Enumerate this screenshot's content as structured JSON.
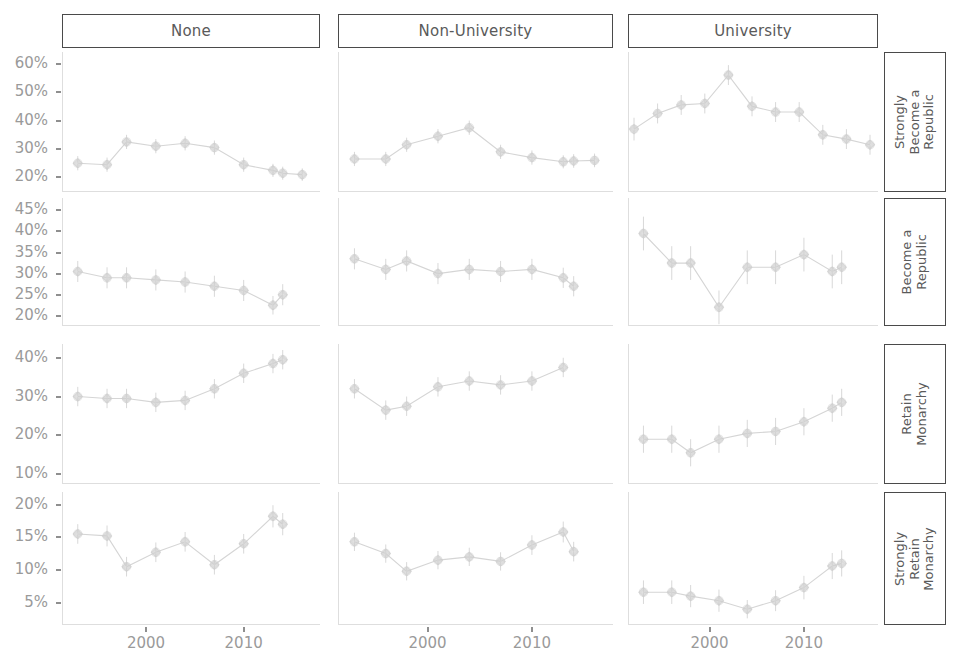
{
  "chart_data": {
    "type": "line",
    "title": "",
    "subtitle": "",
    "xlabel": "",
    "ylabel": "",
    "grid": false,
    "legend": "none",
    "facet_columns_label": "Education",
    "facet_rows_label": "Attitude to the Monarchy",
    "facet_columns": [
      "None",
      "Non-University",
      "University"
    ],
    "facet_rows": [
      "Strongly Become a Republic",
      "Become a Republic",
      "Retain Monarchy",
      "Strongly Retain Monarchy"
    ],
    "x": [
      1993,
      1996,
      1998,
      2001,
      2004,
      2007,
      2010,
      2013,
      2014,
      2016
    ],
    "xlim": [
      1992,
      2017
    ],
    "xticks": [
      2000,
      2010
    ],
    "xticklabels": [
      "2000",
      "2010"
    ],
    "row_axes": [
      {
        "row": "Strongly Become a Republic",
        "ylim": [
          17,
          62
        ],
        "yticks": [
          20,
          30,
          40,
          50,
          60
        ],
        "yticklabels": [
          "20%",
          "30%",
          "40%",
          "50%",
          "60%"
        ]
      },
      {
        "row": "Become a Republic",
        "ylim": [
          19,
          46.5
        ],
        "yticks": [
          20,
          25,
          30,
          35,
          40,
          45
        ],
        "yticklabels": [
          "20%",
          "25%",
          "30%",
          "35%",
          "40%",
          "45%"
        ]
      },
      {
        "row": "Retain Monarchy",
        "ylim": [
          9,
          42
        ],
        "yticks": [
          10,
          20,
          30,
          40
        ],
        "yticklabels": [
          "10%",
          "20%",
          "30%",
          "40%"
        ]
      },
      {
        "row": "Strongly Retain Monarchy",
        "ylim": [
          2.5,
          21
        ],
        "yticks": [
          5,
          10,
          15,
          20
        ],
        "yticklabels": [
          "5%",
          "10%",
          "15%",
          "20%"
        ]
      }
    ],
    "panels": [
      {
        "row": "Strongly Become a Republic",
        "column": "None",
        "values": [
          25.0,
          24.5,
          32.5,
          31.0,
          32.0,
          30.5,
          24.5,
          22.5,
          21.5,
          21.0
        ],
        "err_low": [
          22.5,
          22.0,
          30.0,
          28.5,
          29.5,
          28.0,
          22.0,
          20.2,
          19.2,
          18.8
        ],
        "err_high": [
          27.5,
          27.0,
          35.0,
          33.5,
          34.5,
          33.0,
          27.0,
          24.8,
          23.8,
          23.2
        ]
      },
      {
        "row": "Strongly Become a Republic",
        "column": "Non-University",
        "values": [
          26.5,
          26.5,
          31.5,
          34.5,
          37.5,
          29.0,
          27.0,
          25.5,
          25.8,
          26.0
        ],
        "err_low": [
          24.0,
          24.0,
          29.0,
          32.0,
          35.0,
          26.5,
          24.5,
          23.2,
          23.4,
          23.6
        ],
        "err_high": [
          29.0,
          29.0,
          34.0,
          37.0,
          40.0,
          31.5,
          29.5,
          27.8,
          28.2,
          28.4
        ]
      },
      {
        "row": "Strongly Become a Republic",
        "column": "University",
        "values": [
          37.0,
          42.5,
          45.5,
          46.0,
          56.0,
          45.0,
          43.0,
          43.0,
          35.0,
          33.5,
          31.5
        ],
        "err_low": [
          33.0,
          39.0,
          42.0,
          42.5,
          52.5,
          41.5,
          39.5,
          39.5,
          31.5,
          30.0,
          28.0
        ],
        "err_high": [
          41.0,
          46.0,
          49.0,
          49.5,
          59.5,
          48.5,
          46.5,
          46.5,
          38.5,
          37.0,
          35.0
        ]
      },
      {
        "row": "Become a Republic",
        "column": "None",
        "values": [
          30.5,
          29.0,
          29.0,
          28.5,
          28.0,
          27.0,
          26.0,
          22.5,
          25.0
        ],
        "err_low": [
          28.0,
          26.5,
          26.5,
          26.0,
          25.5,
          24.5,
          23.5,
          20.3,
          22.5
        ],
        "err_high": [
          33.0,
          31.5,
          31.5,
          31.0,
          30.5,
          29.5,
          28.5,
          24.7,
          27.5
        ]
      },
      {
        "row": "Become a Republic",
        "column": "Non-University",
        "values": [
          33.5,
          31.0,
          33.0,
          30.0,
          31.0,
          30.5,
          31.0,
          29.0,
          27.0
        ],
        "err_low": [
          31.0,
          28.5,
          30.5,
          27.5,
          28.5,
          28.0,
          28.5,
          26.6,
          24.6
        ],
        "err_high": [
          36.0,
          33.5,
          35.5,
          32.5,
          33.5,
          33.0,
          33.5,
          31.4,
          29.4
        ]
      },
      {
        "row": "Become a Republic",
        "column": "University",
        "values": [
          39.5,
          32.5,
          32.5,
          22.0,
          31.5,
          31.5,
          34.5,
          30.5,
          31.5
        ],
        "err_low": [
          35.5,
          28.5,
          28.5,
          18.0,
          27.5,
          27.5,
          30.5,
          26.5,
          27.5
        ],
        "err_high": [
          43.5,
          36.5,
          36.5,
          26.0,
          35.5,
          35.5,
          38.5,
          34.5,
          35.5
        ]
      },
      {
        "row": "Retain Monarchy",
        "column": "None",
        "values": [
          30.0,
          29.5,
          29.5,
          28.5,
          29.0,
          32.0,
          36.0,
          38.5,
          39.5
        ],
        "err_low": [
          27.5,
          27.0,
          27.0,
          26.0,
          26.5,
          29.5,
          33.5,
          36.0,
          37.0
        ],
        "err_high": [
          32.5,
          32.0,
          32.0,
          31.0,
          31.5,
          34.5,
          38.5,
          41.0,
          42.0
        ]
      },
      {
        "row": "Retain Monarchy",
        "column": "Non-University",
        "values": [
          32.0,
          26.5,
          27.5,
          32.5,
          34.0,
          33.0,
          34.0,
          37.5
        ],
        "err_low": [
          29.5,
          24.0,
          25.0,
          30.0,
          31.5,
          30.5,
          31.5,
          35.0
        ],
        "err_high": [
          34.5,
          29.0,
          30.0,
          35.0,
          36.5,
          35.5,
          36.5,
          40.0
        ]
      },
      {
        "row": "Retain Monarchy",
        "column": "University",
        "values": [
          19.0,
          19.0,
          15.5,
          19.0,
          20.5,
          21.0,
          23.5,
          27.0,
          28.5
        ],
        "err_low": [
          15.5,
          15.5,
          12.0,
          15.5,
          17.0,
          17.5,
          20.0,
          23.5,
          25.0
        ],
        "err_high": [
          22.5,
          22.5,
          19.0,
          22.5,
          24.0,
          24.5,
          27.0,
          30.5,
          32.0
        ]
      },
      {
        "row": "Strongly Retain Monarchy",
        "column": "None",
        "values": [
          15.5,
          15.2,
          10.5,
          12.7,
          14.3,
          10.8,
          14.0,
          18.2,
          17.0
        ],
        "err_low": [
          14.0,
          13.6,
          9.0,
          11.2,
          12.8,
          9.3,
          12.5,
          16.5,
          15.3
        ],
        "err_high": [
          17.0,
          16.8,
          12.0,
          14.2,
          15.8,
          12.3,
          15.5,
          19.9,
          18.7
        ]
      },
      {
        "row": "Strongly Retain Monarchy",
        "column": "Non-University",
        "values": [
          14.3,
          12.5,
          9.8,
          11.5,
          12.0,
          11.3,
          13.8,
          15.8,
          12.8
        ],
        "err_low": [
          12.9,
          11.1,
          8.4,
          10.1,
          10.6,
          9.9,
          12.3,
          14.2,
          11.3
        ],
        "err_high": [
          15.7,
          13.9,
          11.2,
          12.9,
          13.4,
          12.7,
          15.3,
          17.4,
          14.3
        ]
      },
      {
        "row": "Strongly Retain Monarchy",
        "column": "University",
        "values": [
          6.6,
          6.6,
          6.0,
          5.3,
          4.0,
          5.3,
          7.3,
          10.6,
          11.0
        ],
        "err_low": [
          4.8,
          4.8,
          4.3,
          3.6,
          2.6,
          3.7,
          5.5,
          8.6,
          9.0
        ],
        "err_high": [
          8.4,
          8.4,
          7.7,
          7.0,
          5.4,
          6.9,
          9.1,
          12.6,
          13.0
        ]
      }
    ],
    "colors": {
      "marker": "#cfcfcf",
      "line": "#d5d5d5",
      "errorbar": "#d8d8d8",
      "axis_text": "#9a9a9a",
      "strip_border": "#4a4a4a",
      "strip_text": "#5a5a5a",
      "panel_border": "#dedede",
      "background": "#ffffff"
    }
  },
  "layout": {
    "columns": [
      {
        "label": "None",
        "left": 62,
        "width": 258
      },
      {
        "label": "Non-University",
        "left": 338,
        "width": 275
      },
      {
        "label": "University",
        "left": 628,
        "width": 250
      }
    ],
    "rows": [
      {
        "label": "Strongly Become a Republic",
        "top": 52,
        "height": 140
      },
      {
        "label": "Become a Republic",
        "top": 198,
        "height": 128
      },
      {
        "label": "Retain Monarchy",
        "top": 344,
        "height": 140
      },
      {
        "label": "Strongly Retain Monarchy",
        "top": 492,
        "height": 133
      }
    ],
    "strip_top": 14,
    "strip_height": 34,
    "row_strip_left": 884,
    "row_strip_width": 62
  }
}
